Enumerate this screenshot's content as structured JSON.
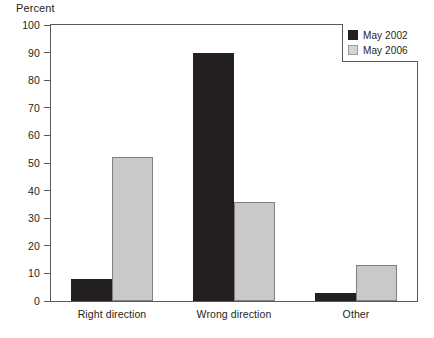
{
  "chart_data": {
    "type": "bar",
    "title": "",
    "xlabel": "",
    "ylabel": "Percent",
    "ylim": [
      0,
      100
    ],
    "yticks": [
      0,
      10,
      20,
      30,
      40,
      50,
      60,
      70,
      80,
      90,
      100
    ],
    "ytick_labels": [
      "0",
      "10",
      "20",
      "30",
      "40",
      "50",
      "60",
      "70",
      "80",
      "90",
      "100"
    ],
    "grid": false,
    "legend_position": "top-right",
    "categories": [
      "Right direction",
      "Wrong direction",
      "Other"
    ],
    "series": [
      {
        "name": "May 2002",
        "color": "#231f20",
        "values": [
          8,
          90,
          3
        ]
      },
      {
        "name": "May 2006",
        "color": "#c9c9c9",
        "values": [
          52,
          36,
          13
        ]
      }
    ]
  },
  "legend": {
    "entries": [
      {
        "label": "May 2002",
        "swatch": "dark"
      },
      {
        "label": "May 2006",
        "swatch": "light"
      }
    ]
  },
  "axis": {
    "y_title": "Percent"
  }
}
